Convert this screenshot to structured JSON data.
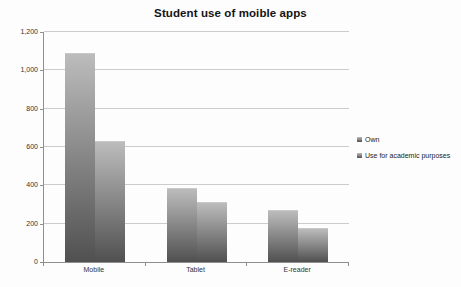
{
  "window": {
    "width": 461,
    "height": 287,
    "background": "#fdfdfd"
  },
  "chart_data": {
    "type": "bar",
    "title": "Student use of moible apps",
    "categories": [
      "Mobile",
      "Tablet",
      "E-reader"
    ],
    "series": [
      {
        "name": "Own",
        "values": [
          1090,
          385,
          270
        ]
      },
      {
        "name": "Use for academic purposes",
        "values": [
          630,
          315,
          180
        ]
      }
    ],
    "xlabel": "",
    "ylabel": "",
    "ylim": [
      0,
      1200
    ],
    "ytick_step": 200,
    "ytick_labels": [
      "0",
      "200",
      "400",
      "600",
      "800",
      "1,000",
      "1,200"
    ],
    "grid": true,
    "legend_position": "right",
    "colors": {
      "bar_gradient_top": "#bcbcbc",
      "bar_gradient_bottom": "#505050",
      "gridline": "#cccccc",
      "axis": "#8f8f8f",
      "text": "#333333",
      "title_text": "#141414"
    }
  }
}
